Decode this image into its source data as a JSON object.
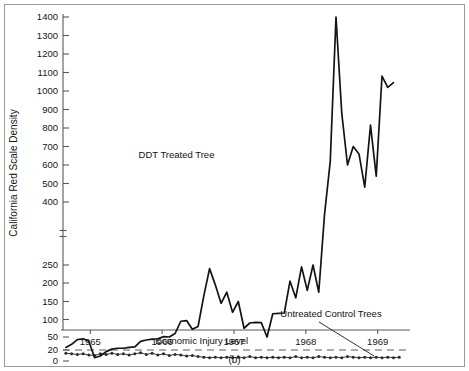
{
  "figure": {
    "caption": "(b)",
    "background_color": "#ffffff",
    "line_color": "#141414",
    "axis_color": "#55595c"
  },
  "chart_data": {
    "type": "line",
    "title": "",
    "xlabel": "",
    "ylabel": "California Red Scale Density",
    "grid": false,
    "legend_position": "inline-annotations",
    "axis_break": {
      "present": true,
      "between": [
        250,
        400
      ],
      "note": "y-axis scale changes above 250"
    },
    "ylim": [
      0,
      1400
    ],
    "ytick_labels": [
      "0",
      "20",
      "50",
      "100",
      "150",
      "200",
      "250",
      "400",
      "500",
      "600",
      "700",
      "800",
      "900",
      "1000",
      "1100",
      "1200",
      "1300",
      "1400"
    ],
    "ytick_values": [
      0,
      20,
      50,
      100,
      150,
      200,
      250,
      400,
      500,
      600,
      700,
      800,
      900,
      1000,
      1100,
      1200,
      1300,
      1400
    ],
    "xtick_labels": [
      "1965",
      "1966",
      "1967",
      "1968",
      "1969"
    ],
    "xtick_values": [
      1965,
      1966,
      1967,
      1968,
      1969
    ],
    "xlim": [
      1964.62,
      1969.45
    ],
    "annotations": [
      {
        "text": "DDT Treated Tree",
        "x": 1966.2,
        "y": 640
      },
      {
        "text": "Untreated Control Trees",
        "x": 1968.35,
        "y": 107
      },
      {
        "text": "Economic Injury Level",
        "x": 1966.55,
        "y": 34
      }
    ],
    "threshold": {
      "label": "Economic Injury Level",
      "value": 20
    },
    "series": [
      {
        "name": "DDT Treated Tree",
        "marker": "none",
        "x": [
          1964.66,
          1964.74,
          1964.82,
          1964.9,
          1964.98,
          1965.06,
          1965.14,
          1965.22,
          1965.3,
          1965.38,
          1965.46,
          1965.54,
          1965.62,
          1965.7,
          1965.78,
          1965.86,
          1965.94,
          1966.02,
          1966.1,
          1966.18,
          1966.26,
          1966.34,
          1966.42,
          1966.5,
          1966.58,
          1966.66,
          1966.74,
          1966.82,
          1966.9,
          1966.98,
          1967.06,
          1967.14,
          1967.22,
          1967.3,
          1967.38,
          1967.46,
          1967.54,
          1967.62,
          1967.7,
          1967.78,
          1967.86,
          1967.94,
          1968.02,
          1968.1,
          1968.18,
          1968.26,
          1968.34,
          1968.42,
          1968.5,
          1968.58,
          1968.66,
          1968.74,
          1968.82,
          1968.9,
          1968.98,
          1969.06,
          1969.14,
          1969.22
        ],
        "y": [
          26,
          33,
          44,
          46,
          40,
          6,
          9,
          17,
          22,
          24,
          24,
          26,
          27,
          40,
          43,
          45,
          46,
          51,
          50,
          60,
          95,
          97,
          72,
          80,
          165,
          240,
          195,
          145,
          175,
          120,
          150,
          75,
          90,
          92,
          91,
          50,
          116,
          117,
          118,
          205,
          160,
          245,
          180,
          250,
          175,
          370,
          620,
          1400,
          880,
          600,
          700,
          660,
          480,
          815,
          540,
          1080,
          1020,
          1045
        ]
      },
      {
        "name": "Untreated Control Trees",
        "marker": "dot",
        "x": [
          1964.66,
          1964.74,
          1964.82,
          1964.9,
          1964.98,
          1965.06,
          1965.14,
          1965.22,
          1965.3,
          1965.38,
          1965.46,
          1965.54,
          1965.62,
          1965.7,
          1965.78,
          1965.86,
          1965.94,
          1966.02,
          1966.1,
          1966.18,
          1966.26,
          1966.34,
          1966.42,
          1966.5,
          1966.58,
          1966.66,
          1966.74,
          1966.82,
          1966.9,
          1966.98,
          1967.06,
          1967.14,
          1967.22,
          1967.3,
          1967.38,
          1967.46,
          1967.54,
          1967.62,
          1967.7,
          1967.78,
          1967.86,
          1967.94,
          1968.02,
          1968.1,
          1968.18,
          1968.26,
          1968.34,
          1968.42,
          1968.5,
          1968.58,
          1968.66,
          1968.74,
          1968.82,
          1968.9,
          1968.98,
          1969.06,
          1969.14,
          1969.22,
          1969.3
        ],
        "y": [
          14,
          13,
          12,
          13,
          11,
          10,
          13,
          12,
          14,
          12,
          13,
          11,
          13,
          15,
          12,
          14,
          11,
          13,
          10,
          12,
          11,
          9,
          10,
          8,
          7,
          6,
          7,
          6,
          7,
          6,
          7,
          6,
          8,
          6,
          7,
          6,
          7,
          6,
          7,
          6,
          8,
          6,
          7,
          6,
          8,
          7,
          6,
          7,
          6,
          8,
          7,
          6,
          7,
          6,
          7,
          6,
          7,
          6,
          7
        ]
      }
    ]
  }
}
